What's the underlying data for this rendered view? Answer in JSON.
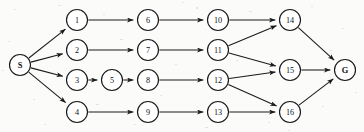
{
  "figure": {
    "kind": "directed-graph-diagram",
    "title": "",
    "background_color": "#fbfbf9",
    "node_fill": "#ffffff",
    "stroke_color": "#1a1a1a",
    "width": 364,
    "height": 132
  },
  "nodes": [
    {
      "id": "S",
      "label": "S",
      "x": 20,
      "y": 65,
      "r": 10.5,
      "terminal": true
    },
    {
      "id": "1",
      "label": "1",
      "x": 77,
      "y": 20,
      "r": 10.5,
      "terminal": false
    },
    {
      "id": "2",
      "label": "2",
      "x": 77,
      "y": 50,
      "r": 10.5,
      "terminal": false
    },
    {
      "id": "3",
      "label": "3",
      "x": 77,
      "y": 80,
      "r": 10.5,
      "terminal": false
    },
    {
      "id": "4",
      "label": "4",
      "x": 77,
      "y": 112,
      "r": 10.5,
      "terminal": false
    },
    {
      "id": "5",
      "label": "5",
      "x": 112,
      "y": 80,
      "r": 10.5,
      "terminal": false
    },
    {
      "id": "6",
      "label": "6",
      "x": 148,
      "y": 20,
      "r": 10.5,
      "terminal": false
    },
    {
      "id": "7",
      "label": "7",
      "x": 148,
      "y": 50,
      "r": 10.5,
      "terminal": false
    },
    {
      "id": "8",
      "label": "8",
      "x": 148,
      "y": 80,
      "r": 10.5,
      "terminal": false
    },
    {
      "id": "9",
      "label": "9",
      "x": 148,
      "y": 112,
      "r": 10.5,
      "terminal": false
    },
    {
      "id": "10",
      "label": "10",
      "x": 218,
      "y": 20,
      "r": 10.5,
      "terminal": false
    },
    {
      "id": "11",
      "label": "11",
      "x": 218,
      "y": 50,
      "r": 10.5,
      "terminal": false
    },
    {
      "id": "12",
      "label": "12",
      "x": 218,
      "y": 80,
      "r": 10.5,
      "terminal": false
    },
    {
      "id": "13",
      "label": "13",
      "x": 218,
      "y": 112,
      "r": 10.5,
      "terminal": false
    },
    {
      "id": "14",
      "label": "14",
      "x": 290,
      "y": 20,
      "r": 10.5,
      "terminal": false
    },
    {
      "id": "15",
      "label": "15",
      "x": 290,
      "y": 70,
      "r": 10.5,
      "terminal": false
    },
    {
      "id": "16",
      "label": "16",
      "x": 290,
      "y": 112,
      "r": 10.5,
      "terminal": false
    },
    {
      "id": "G",
      "label": "G",
      "x": 345,
      "y": 70,
      "r": 10.5,
      "terminal": true
    }
  ],
  "edges": [
    {
      "from": "S",
      "to": "1"
    },
    {
      "from": "S",
      "to": "2"
    },
    {
      "from": "S",
      "to": "3"
    },
    {
      "from": "S",
      "to": "4"
    },
    {
      "from": "1",
      "to": "6"
    },
    {
      "from": "2",
      "to": "7"
    },
    {
      "from": "3",
      "to": "5"
    },
    {
      "from": "5",
      "to": "8"
    },
    {
      "from": "4",
      "to": "9"
    },
    {
      "from": "6",
      "to": "10"
    },
    {
      "from": "7",
      "to": "11"
    },
    {
      "from": "8",
      "to": "12"
    },
    {
      "from": "9",
      "to": "13"
    },
    {
      "from": "10",
      "to": "14"
    },
    {
      "from": "11",
      "to": "14"
    },
    {
      "from": "11",
      "to": "15"
    },
    {
      "from": "12",
      "to": "15"
    },
    {
      "from": "12",
      "to": "16"
    },
    {
      "from": "13",
      "to": "16"
    },
    {
      "from": "14",
      "to": "G"
    },
    {
      "from": "15",
      "to": "G"
    },
    {
      "from": "16",
      "to": "G"
    }
  ]
}
